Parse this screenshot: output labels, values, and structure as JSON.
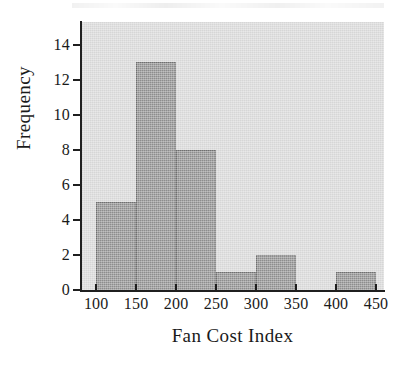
{
  "figure": {
    "background_color": "#ffffff",
    "plot_background_color": "#d6d6d6",
    "bar_color": "#8d8d8d",
    "bar_edge_color": "#6d6d6d",
    "axis_color": "#1f1f1f"
  },
  "chart_data": {
    "type": "bar",
    "title": "",
    "xlabel": "Fan Cost Index",
    "ylabel": "Frequency",
    "categories": [
      "100-150",
      "150-200",
      "200-250",
      "250-300",
      "300-350",
      "350-400",
      "400-450"
    ],
    "bin_edges": [
      100,
      150,
      200,
      250,
      300,
      350,
      400,
      450
    ],
    "values": [
      5,
      13,
      8,
      1,
      2,
      0,
      1
    ],
    "bin_width": 50,
    "xlim": [
      81,
      460
    ],
    "ylim": [
      0,
      15.3
    ],
    "xticks": [
      100,
      150,
      200,
      250,
      300,
      350,
      400,
      450
    ],
    "xtick_labels": [
      "100",
      "150",
      "200",
      "250",
      "300",
      "350",
      "400",
      "450"
    ],
    "yticks": [
      0,
      2,
      4,
      6,
      8,
      10,
      12,
      14
    ],
    "ytick_labels": [
      "0",
      "2",
      "4",
      "6",
      "8",
      "10",
      "12",
      "14"
    ],
    "grid": false,
    "legend": null,
    "total_count": 30
  }
}
